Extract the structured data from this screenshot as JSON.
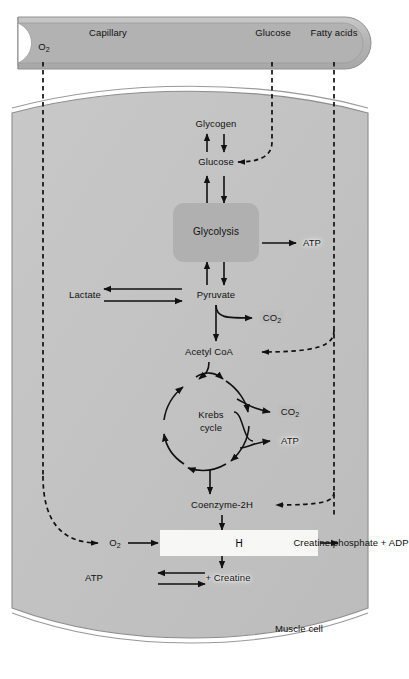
{
  "diagram": {
    "capillary_label": "Capillary",
    "cell_label": "Muscle cell"
  },
  "colors": {
    "capillary_fill": "#b9b9b9",
    "capillary_edge": "#9a9a9a",
    "cell_fill": "#c4c4c4",
    "cell_membrane": "#8d8d8d",
    "glycolysis_box": "#b0b0b0",
    "oxphos_box": "#f7f7f5",
    "badge": "#bdbdbd",
    "stroke": "#111111",
    "page_bg": "#ffffff"
  },
  "capillary": {
    "substrates": [
      {
        "name": "o2",
        "label": "O",
        "sub": "2"
      },
      {
        "name": "glucose",
        "label": "Glucose",
        "sub": ""
      },
      {
        "name": "fatty-acids",
        "label": "Fatty acids",
        "sub": ""
      }
    ]
  },
  "nodes": [
    {
      "id": "glycogen",
      "label": "Glycogen",
      "sub": "",
      "x": 216,
      "y": 124,
      "style": "plain"
    },
    {
      "id": "glucose",
      "label": "Glucose",
      "sub": "",
      "x": 216,
      "y": 162,
      "style": "plain"
    },
    {
      "id": "glycolysis",
      "label": "Glycolysis",
      "sub": "",
      "x": 216,
      "y": 232,
      "style": "box"
    },
    {
      "id": "atp1",
      "label": "ATP",
      "sub": "",
      "x": 312,
      "y": 243,
      "style": "glow"
    },
    {
      "id": "lactate",
      "label": "Lactate",
      "sub": "",
      "x": 85,
      "y": 295,
      "style": "plain"
    },
    {
      "id": "pyruvate",
      "label": "Pyruvate",
      "sub": "",
      "x": 216,
      "y": 295,
      "style": "plain"
    },
    {
      "id": "co2a",
      "label": "CO",
      "sub": "2",
      "x": 272,
      "y": 318,
      "style": "badge"
    },
    {
      "id": "acetylcoa",
      "label": "Acetyl CoA",
      "sub": "",
      "x": 209,
      "y": 352,
      "style": "plain"
    },
    {
      "id": "krebs1",
      "label": "Krebs",
      "sub": "",
      "x": 211,
      "y": 415,
      "style": "plain"
    },
    {
      "id": "krebs2",
      "label": "cycle",
      "sub": "",
      "x": 211,
      "y": 428,
      "style": "plain"
    },
    {
      "id": "co2b",
      "label": "CO",
      "sub": "2",
      "x": 290,
      "y": 412,
      "style": "badge"
    },
    {
      "id": "atp2",
      "label": "ATP",
      "sub": "",
      "x": 290,
      "y": 441,
      "style": "glow"
    },
    {
      "id": "coenzyme",
      "label": "Coenzyme-2H",
      "sub": "",
      "x": 222,
      "y": 505,
      "style": "plain"
    },
    {
      "id": "o2cell",
      "label": "O",
      "sub": "2",
      "x": 115,
      "y": 543,
      "style": "plain"
    },
    {
      "id": "oxphos",
      "label": "Oxidative Phosphorylation",
      "sub": "",
      "x": 238,
      "y": 543,
      "style": "bigbox"
    },
    {
      "id": "h2o",
      "label": "H",
      "sub": "2",
      "suffix": "O",
      "x": 349,
      "y": 543,
      "style": "plain"
    },
    {
      "id": "crp",
      "label": "Creatine phosphate + ADP",
      "sub": "",
      "x": 94,
      "y": 578,
      "style": "plain"
    },
    {
      "id": "atp3",
      "label": "ATP",
      "sub": "",
      "x": 228,
      "y": 578,
      "style": "glow"
    },
    {
      "id": "creatine",
      "label": "+ Creatine",
      "sub": "",
      "x": 276,
      "y": 578,
      "style": "plain"
    }
  ],
  "reactions": [
    {
      "name": "glycogen-glucose",
      "type": "reversible"
    },
    {
      "name": "glucose-glycolysis",
      "type": "reversible"
    },
    {
      "name": "glycolysis-atp",
      "type": "irreversible"
    },
    {
      "name": "glycolysis-pyruvate",
      "type": "reversible"
    },
    {
      "name": "lactate-pyruvate",
      "type": "reversible"
    },
    {
      "name": "pyruvate-co2",
      "type": "irreversible"
    },
    {
      "name": "pyruvate-acetylcoa",
      "type": "irreversible"
    },
    {
      "name": "krebs-co2",
      "type": "irreversible"
    },
    {
      "name": "krebs-atp",
      "type": "irreversible"
    },
    {
      "name": "krebs-coenzyme",
      "type": "irreversible"
    },
    {
      "name": "coenzyme-oxphos",
      "type": "irreversible"
    },
    {
      "name": "o2-oxphos",
      "type": "irreversible"
    },
    {
      "name": "oxphos-h2o",
      "type": "irreversible"
    },
    {
      "name": "oxphos-atp",
      "type": "irreversible"
    },
    {
      "name": "creatine-shuttle",
      "type": "reversible"
    },
    {
      "name": "glucose-uptake",
      "type": "transport-dashed"
    },
    {
      "name": "o2-uptake",
      "type": "transport-dashed"
    },
    {
      "name": "fatty-acid-uptake",
      "type": "transport-dashed"
    }
  ]
}
